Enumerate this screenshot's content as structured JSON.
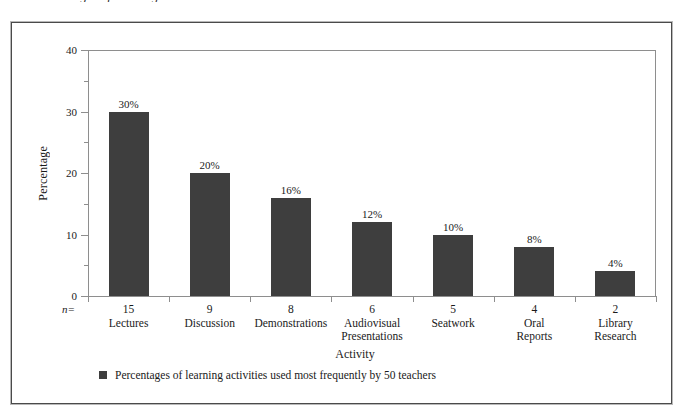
{
  "figure": {
    "caption_sliver": "Percentages of learning activities",
    "n_marker": "n="
  },
  "legend": {
    "label": "Percentages of learning activities used most frequently by 50 teachers",
    "swatch_color": "#3e3e3e"
  },
  "chart_data": {
    "type": "bar",
    "title": "",
    "xlabel": "Activity",
    "ylabel": "Percentage",
    "ylim": [
      0,
      40
    ],
    "ytick_labels": [
      "0",
      "10",
      "20",
      "30",
      "40"
    ],
    "ytick_values": [
      0,
      10,
      20,
      30,
      40
    ],
    "yminor_values": [
      5,
      15,
      25,
      35
    ],
    "grid": false,
    "legend_position": "bottom-left",
    "bar_color": "#3e3e3e",
    "value_label_suffix": "%",
    "categories": [
      "Lectures",
      "Discussion",
      "Demonstrations",
      "Audiovisual Presentations",
      "Seatwork",
      "Oral Reports",
      "Library Research"
    ],
    "category_lines": [
      [
        "Lectures"
      ],
      [
        "Discussion"
      ],
      [
        "Demonstrations"
      ],
      [
        "Audiovisual",
        "Presentations"
      ],
      [
        "Seatwork"
      ],
      [
        "Oral",
        "Reports"
      ],
      [
        "Library",
        "Research"
      ]
    ],
    "values": [
      30,
      20,
      16,
      12,
      10,
      8,
      4
    ],
    "value_labels": [
      "30%",
      "20%",
      "16%",
      "12%",
      "10%",
      "8%",
      "4%"
    ],
    "n_values": [
      15,
      9,
      8,
      6,
      5,
      4,
      2
    ],
    "n_labels": [
      "15",
      "9",
      "8",
      "6",
      "5",
      "4",
      "2"
    ]
  }
}
